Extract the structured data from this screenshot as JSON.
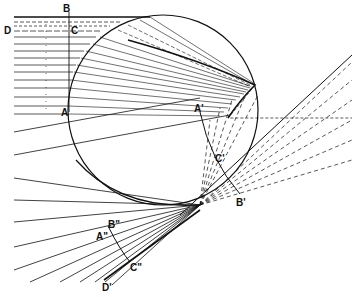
{
  "diagram": {
    "labels": {
      "B": "B",
      "C": "C",
      "D": "D",
      "A": "A",
      "A_prime": "A'",
      "B_prime": "B'",
      "C_prime": "C'",
      "B_dprime": "B\"",
      "A_dprime": "A\"",
      "C_dprime": "C\"",
      "D_prime": "D'"
    },
    "colors": {
      "ink": "#111111",
      "background": "#ffffff"
    }
  }
}
